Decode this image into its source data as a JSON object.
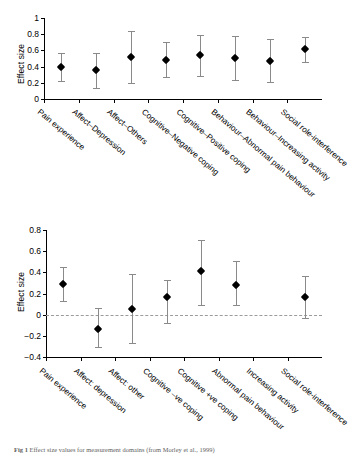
{
  "caption": {
    "prefix": "Fig 1",
    "text": "Effect size values for measurement domains (from Morley et al., 1999)"
  },
  "chart_data": [
    {
      "id": "top",
      "type": "scatter",
      "title": "",
      "xlabel": "",
      "ylabel": "Effect size",
      "ylim": [
        0,
        1
      ],
      "yticks": [
        0,
        0.2,
        0.4,
        0.6,
        0.8,
        1
      ],
      "ytick_labels": [
        "0",
        "0.2",
        "0.4",
        "0.6",
        "0.8",
        "1"
      ],
      "grid": false,
      "legend": "none",
      "error_bars": "confidence interval",
      "categories": [
        "Pain experience",
        "Affect–Depression",
        "Affect–Others",
        "Cognitive–Negative coping",
        "Cognitive–Positive coping",
        "Behaviour–Abnormal pain behaviour",
        "Behaviour–Increasing activity",
        "Social role-interference"
      ],
      "values": [
        0.4,
        0.36,
        0.52,
        0.48,
        0.54,
        0.51,
        0.47,
        0.62
      ],
      "ci_lower": [
        0.22,
        0.14,
        0.2,
        0.27,
        0.29,
        0.23,
        0.21,
        0.46
      ],
      "ci_upper": [
        0.57,
        0.57,
        0.84,
        0.7,
        0.79,
        0.78,
        0.74,
        0.77
      ]
    },
    {
      "id": "bottom",
      "type": "scatter",
      "title": "",
      "xlabel": "",
      "ylabel": "Effect size",
      "ylim": [
        -0.4,
        0.8
      ],
      "yticks": [
        -0.4,
        -0.2,
        0,
        0.2,
        0.4,
        0.6,
        0.8
      ],
      "ytick_labels": [
        "−0.4",
        "−0.2",
        "0",
        "0.2",
        "0.4",
        "0.6",
        "0.8"
      ],
      "grid": false,
      "legend": "none",
      "zero_reference_line": 0,
      "error_bars": "confidence interval",
      "categories": [
        "Pain experience",
        "Affect: depression",
        "Affect: other",
        "Cognitive –ve coping",
        "Cognitive +ve coping",
        "Abnormal pain behaviour",
        "Increasing activity",
        "Social role-interference"
      ],
      "values": [
        0.29,
        -0.14,
        0.05,
        0.17,
        0.41,
        0.28,
        null,
        0.17
      ],
      "ci_lower": [
        0.13,
        -0.31,
        -0.27,
        -0.08,
        0.09,
        0.09,
        null,
        -0.03
      ],
      "ci_upper": [
        0.45,
        0.06,
        0.38,
        0.33,
        0.71,
        0.51,
        null,
        0.37
      ]
    }
  ]
}
